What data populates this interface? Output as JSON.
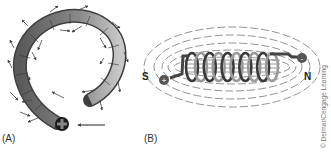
{
  "figure": {
    "panels": [
      {
        "id": "A",
        "label": "(A)",
        "description": "Single curved conductor (one loop) with circular magnetic field arrows; current enters at plus end",
        "current_symbol": "+",
        "colors": {
          "conductor_dark": "#555555",
          "conductor_light": "#bdbdbd",
          "arrow": "#444444"
        }
      },
      {
        "id": "B",
        "label": "(B)",
        "description": "Coil (solenoid) with dashed magnetic flux lines from pole to pole",
        "pole_left": "S",
        "pole_right": "N",
        "terminal_left": "+",
        "terminal_right": "-",
        "coil_turns": 10,
        "colors": {
          "coil_dark": "#3a3a3a",
          "coil_light": "#9a9a9a",
          "field_line": "#555555"
        }
      }
    ],
    "credit": "© Delmar/Cengage Learning"
  }
}
